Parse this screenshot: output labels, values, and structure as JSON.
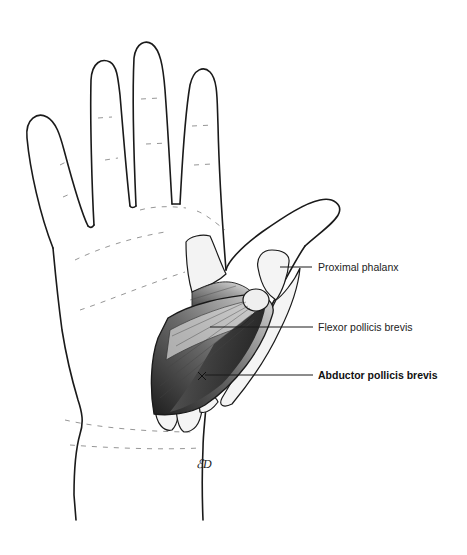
{
  "figure": {
    "labels": [
      {
        "id": "proximal-phalanx",
        "text": "Proximal phalanx",
        "bold": false
      },
      {
        "id": "flexor-pollicis-brevis",
        "text": "Flexor pollicis brevis",
        "bold": false
      },
      {
        "id": "abductor-pollicis-brevis",
        "text": "Abductor pollicis brevis",
        "bold": true
      }
    ],
    "signature": "ED",
    "colors": {
      "line": "#1a1a1a",
      "shade": "#2b2b2b",
      "background": "#ffffff"
    }
  }
}
